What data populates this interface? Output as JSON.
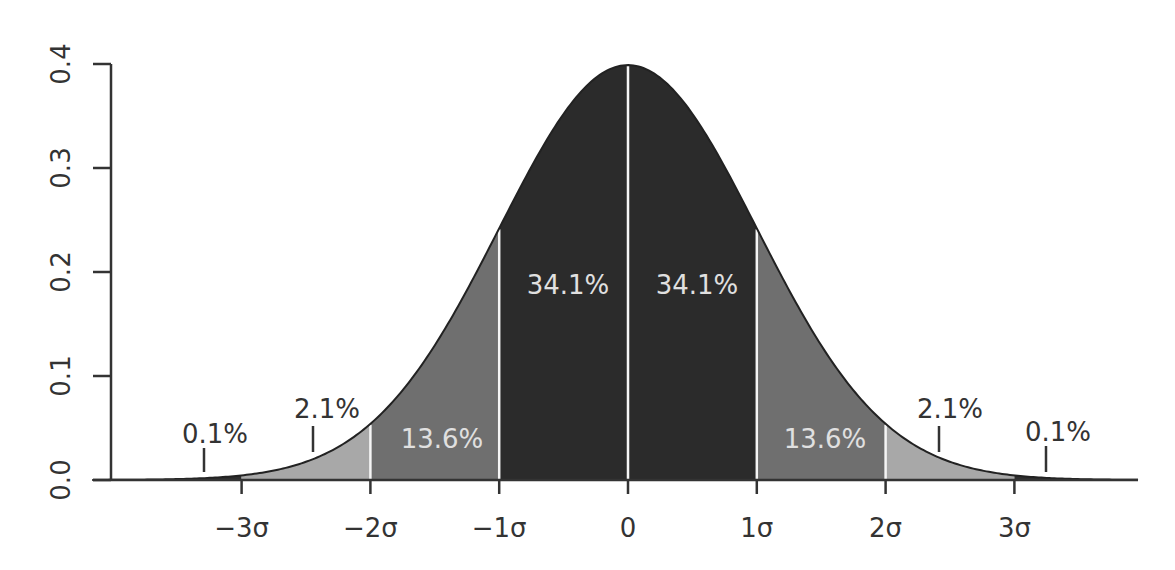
{
  "chart_data": {
    "type": "area",
    "title": "",
    "xlabel": "",
    "ylabel": "",
    "distribution": "standard normal",
    "mean": 0,
    "sd": 1,
    "xlim": [
      -4.16,
      3.96
    ],
    "ylim": [
      0,
      0.4
    ],
    "grid": false,
    "legend": "none",
    "y_ticks": [
      {
        "value": 0.0,
        "label": "0.0"
      },
      {
        "value": 0.1,
        "label": "0.1"
      },
      {
        "value": 0.2,
        "label": "0.2"
      },
      {
        "value": 0.3,
        "label": "0.3"
      },
      {
        "value": 0.4,
        "label": "0.4"
      }
    ],
    "x_ticks": [
      {
        "value": -3,
        "label": "−3σ"
      },
      {
        "value": -2,
        "label": "−2σ"
      },
      {
        "value": -1,
        "label": "−1σ"
      },
      {
        "value": 0,
        "label": "0"
      },
      {
        "value": 1,
        "label": "1σ"
      },
      {
        "value": 2,
        "label": "2σ"
      },
      {
        "value": 3,
        "label": "3σ"
      }
    ],
    "regions": [
      {
        "from": -4.16,
        "to": -3,
        "percent": 0.1,
        "label": "0.1%",
        "color": "#2e2e2e"
      },
      {
        "from": -3,
        "to": -2,
        "percent": 2.1,
        "label": "2.1%",
        "color": "#a8a8a8"
      },
      {
        "from": -2,
        "to": -1,
        "percent": 13.6,
        "label": "13.6%",
        "color": "#6f6f6f"
      },
      {
        "from": -1,
        "to": 0,
        "percent": 34.1,
        "label": "34.1%",
        "color": "#2b2b2b"
      },
      {
        "from": 0,
        "to": 1,
        "percent": 34.1,
        "label": "34.1%",
        "color": "#2b2b2b"
      },
      {
        "from": 1,
        "to": 2,
        "percent": 13.6,
        "label": "13.6%",
        "color": "#6f6f6f"
      },
      {
        "from": 2,
        "to": 3,
        "percent": 2.1,
        "label": "2.1%",
        "color": "#a8a8a8"
      },
      {
        "from": 3,
        "to": 3.96,
        "percent": 0.1,
        "label": "0.1%",
        "color": "#2e2e2e"
      }
    ],
    "annotations": [
      {
        "text": "0.1%",
        "x": -3.3,
        "pointer": true,
        "style": "dark"
      },
      {
        "text": "2.1%",
        "x": -2.45,
        "pointer": true,
        "style": "dark"
      },
      {
        "text": "13.6%",
        "x": -1.5,
        "pointer": false,
        "style": "light"
      },
      {
        "text": "34.1%",
        "x": -0.5,
        "pointer": false,
        "style": "light"
      },
      {
        "text": "34.1%",
        "x": 0.5,
        "pointer": false,
        "style": "light"
      },
      {
        "text": "13.6%",
        "x": 1.5,
        "pointer": false,
        "style": "light"
      },
      {
        "text": "2.1%",
        "x": 2.4,
        "pointer": true,
        "style": "dark"
      },
      {
        "text": "0.1%",
        "x": 3.25,
        "pointer": true,
        "style": "dark"
      }
    ]
  },
  "colors": {
    "axis": "#333333",
    "curve": "#222222",
    "divider": "#f5f5f5",
    "center": "#2b2b2b",
    "mid": "#6f6f6f",
    "outer": "#a8a8a8",
    "tail": "#2e2e2e"
  }
}
